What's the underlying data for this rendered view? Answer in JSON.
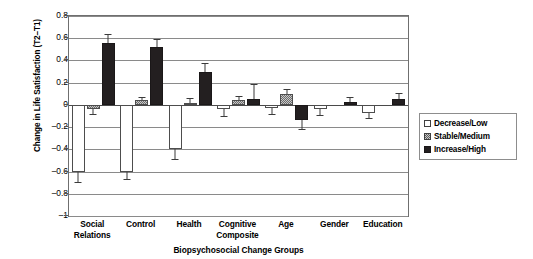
{
  "chart_data": {
    "type": "bar",
    "title": "",
    "xlabel": "Biopsychosocial Change Groups",
    "ylabel": "Change in Life Satisfaction (T2–T1)",
    "ylim": [
      -1,
      0.8
    ],
    "yticks": [
      "0.8",
      "0.6",
      "0.4",
      "0.2",
      "0",
      "–0.2",
      "–0.4",
      "–0.6",
      "–0.8",
      "–1"
    ],
    "ytick_values": [
      0.8,
      0.6,
      0.4,
      0.2,
      0,
      -0.2,
      -0.4,
      -0.6,
      -0.8,
      -1
    ],
    "grid": true,
    "legend_position": "right",
    "categories": [
      "Social Relations",
      "Control",
      "Health",
      "Cognitive Composite",
      "Age",
      "Gender",
      "Education"
    ],
    "category_lines": [
      [
        "Social",
        "Relations"
      ],
      [
        "Control"
      ],
      [
        "Health"
      ],
      [
        "Cognitive",
        "Composite"
      ],
      [
        "Age"
      ],
      [
        "Gender"
      ],
      [
        "Education"
      ]
    ],
    "series": [
      {
        "name": "Decrease/Low",
        "style": "open-white",
        "values": [
          -0.6,
          -0.6,
          -0.4,
          -0.04,
          -0.03,
          -0.04,
          -0.07
        ],
        "errors": [
          0.09,
          0.07,
          0.09,
          0.06,
          0.05,
          0.05,
          0.05
        ]
      },
      {
        "name": "Stable/Medium",
        "style": "checkered-gray",
        "values": [
          -0.04,
          0.04,
          0.02,
          0.04,
          0.1,
          0.0,
          0.0
        ],
        "errors": [
          0.04,
          0.03,
          0.04,
          0.04,
          0.04,
          0.0,
          0.0
        ]
      },
      {
        "name": "Increase/High",
        "style": "solid-black",
        "values": [
          0.56,
          0.52,
          0.3,
          0.05,
          -0.14,
          0.03,
          0.05
        ],
        "errors": [
          0.08,
          0.07,
          0.08,
          0.14,
          0.08,
          0.04,
          0.06
        ]
      }
    ]
  },
  "legend": {
    "items": [
      {
        "label": "Decrease/Low",
        "style": "decrease"
      },
      {
        "label": "Stable/Medium",
        "style": "stable"
      },
      {
        "label": "Increase/High",
        "style": "increase"
      }
    ]
  }
}
